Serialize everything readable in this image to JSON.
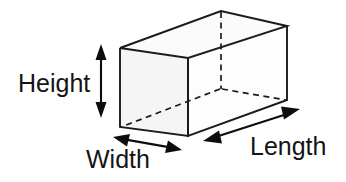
{
  "diagram": {
    "title": "Rectangular box dimensions diagram",
    "background_color": "#ffffff",
    "stroke_color": "#1b1b1b",
    "fill_front": "#f5f5f5",
    "fill_top": "#fbfbfb",
    "fill_right": "#fdfdfd",
    "labels": {
      "height": "Height",
      "width": "Width",
      "length": "Length"
    },
    "annotations": [
      {
        "name": "height-dimension",
        "label": "Height",
        "arrow_type": "double-headed",
        "orientation": "vertical",
        "from": [
          101,
          46
        ],
        "to": [
          101,
          116
        ],
        "label_position": [
          18,
          92
        ]
      },
      {
        "name": "width-dimension",
        "label": "Width",
        "arrow_type": "double-headed",
        "orientation": "diagonal-down-right",
        "from": [
          117,
          138
        ],
        "to": [
          178,
          149
        ],
        "label_position": [
          86,
          168
        ]
      },
      {
        "name": "length-dimension",
        "label": "Length",
        "arrow_type": "double-headed",
        "orientation": "diagonal-up-right",
        "from": [
          205,
          140
        ],
        "to": [
          298,
          110
        ],
        "label_position": [
          250,
          155
        ]
      }
    ],
    "solid": {
      "shape": "rectangular-prism",
      "vertices": {
        "front_top_left": [
          120,
          48
        ],
        "front_top_right": [
          188,
          58
        ],
        "front_bottom_right": [
          188,
          136
        ],
        "front_bottom_left": [
          120,
          127
        ],
        "back_top_left": [
          221,
          11
        ],
        "back_top_right": [
          287,
          26
        ],
        "back_bottom_right": [
          287,
          100
        ],
        "back_bottom_left_hidden": [
          221,
          89
        ]
      },
      "hidden_edges": [
        [
          [
            221,
            11
          ],
          [
            221,
            89
          ]
        ],
        [
          [
            221,
            89
          ],
          [
            120,
            127
          ]
        ],
        [
          [
            221,
            89
          ],
          [
            287,
            100
          ]
        ]
      ]
    }
  }
}
